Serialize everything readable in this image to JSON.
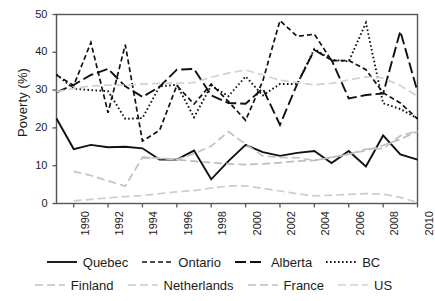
{
  "chart_data": {
    "type": "line",
    "title": "",
    "xlabel": "",
    "ylabel": "Poverty (%)",
    "xlim": [
      1989,
      2010
    ],
    "ylim": [
      0,
      50
    ],
    "grid": false,
    "legend_position": "bottom",
    "x": [
      1989,
      1990,
      1991,
      1992,
      1993,
      1994,
      1995,
      1996,
      1997,
      1998,
      1999,
      2000,
      2001,
      2002,
      2003,
      2004,
      2005,
      2006,
      2007,
      2008,
      2009,
      2010
    ],
    "xticks": [
      1990,
      1992,
      1994,
      1996,
      1998,
      2000,
      2002,
      2004,
      2006,
      2008,
      2010
    ],
    "xticklabels": [
      "1990",
      "1992",
      "1994",
      "1996",
      "1998",
      "2000",
      "2002",
      "2004",
      "2006",
      "2008",
      "2010"
    ],
    "yticks": [
      0,
      10,
      20,
      30,
      40,
      50
    ],
    "yticklabels": [
      "0",
      "10",
      "20",
      "30",
      "40",
      "50"
    ],
    "series": [
      {
        "name": "Quebec",
        "color": "#111111",
        "style": "solid",
        "dash": "none",
        "width": 1.9,
        "values": [
          22.5,
          14.4,
          15.5,
          14.9,
          15.0,
          14.6,
          11.6,
          11.6,
          14.0,
          6.4,
          11.2,
          15.5,
          13.6,
          12.6,
          13.4,
          13.9,
          10.7,
          13.9,
          9.8,
          18.0,
          13.0,
          11.6
        ]
      },
      {
        "name": "Ontario",
        "color": "#111111",
        "style": "dashed",
        "dash": "5,3",
        "width": 1.7,
        "values": [
          34.0,
          31.2,
          42.6,
          24.0,
          42.0,
          16.5,
          19.4,
          31.2,
          26.3,
          31.6,
          27.0,
          22.0,
          32.4,
          48.4,
          44.2,
          44.8,
          37.8,
          37.8,
          35.4,
          29.3,
          26.6,
          22.4
        ]
      },
      {
        "name": "Alberta",
        "color": "#111111",
        "style": "longdash",
        "dash": "11,4",
        "width": 1.9,
        "values": [
          29.4,
          31.4,
          34.0,
          35.6,
          31.0,
          28.2,
          30.9,
          35.4,
          35.6,
          28.6,
          26.6,
          26.4,
          30.4,
          20.8,
          31.6,
          40.6,
          38.0,
          27.8,
          28.7,
          29.1,
          45.6,
          29.6
        ]
      },
      {
        "name": "BC",
        "color": "#111111",
        "style": "dotted",
        "dash": "1.6,2.4",
        "width": 1.9,
        "values": [
          34.1,
          30.4,
          30.0,
          29.7,
          22.4,
          22.6,
          31.0,
          31.4,
          22.8,
          31.2,
          28.4,
          33.6,
          28.6,
          31.6,
          31.6,
          40.9,
          38.0,
          37.6,
          47.8,
          26.5,
          25.0,
          22.5
        ]
      },
      {
        "name": "Finland",
        "color": "#c2c2c2",
        "style": "dashed",
        "dash": "8,4",
        "width": 1.7,
        "values": [
          null,
          8.5,
          7.4,
          6.0,
          4.6,
          12.2,
          12.0,
          11.6,
          13.2,
          15.2,
          19.0,
          15.7,
          12.6,
          12.2,
          12.1,
          11.4,
          12.2,
          13.0,
          14.4,
          14.5,
          17.9,
          19.2
        ]
      },
      {
        "name": "Netherlands",
        "color": "#cccccc",
        "style": "dashed",
        "dash": "8,4",
        "width": 1.7,
        "values": [
          null,
          0.7,
          1.1,
          1.5,
          1.8,
          2.1,
          2.6,
          3.1,
          3.4,
          4.1,
          4.6,
          4.7,
          4.0,
          3.3,
          2.6,
          2.0,
          2.2,
          2.4,
          2.6,
          2.5,
          1.6,
          0.3
        ]
      },
      {
        "name": "France",
        "color": "#bdbdbd",
        "style": "dashed",
        "dash": "8,4",
        "width": 1.7,
        "values": [
          null,
          null,
          null,
          null,
          null,
          12.2,
          11.9,
          11.6,
          11.2,
          10.8,
          10.5,
          10.3,
          10.5,
          10.8,
          11.2,
          11.4,
          12.2,
          13.1,
          14.0,
          15.4,
          17.0,
          19.1
        ]
      },
      {
        "name": "US",
        "color": "#d2d2d2",
        "style": "dashed",
        "dash": "8,4",
        "width": 1.7,
        "values": [
          29.6,
          30.4,
          31.1,
          31.3,
          31.3,
          31.6,
          31.8,
          31.8,
          32.0,
          33.4,
          34.5,
          35.3,
          34.0,
          32.6,
          32.0,
          31.4,
          31.8,
          32.7,
          33.5,
          33.2,
          31.2,
          28.4
        ]
      }
    ]
  },
  "legend": {
    "rows": [
      [
        {
          "label": "Quebec",
          "series": 0
        },
        {
          "label": "Ontario",
          "series": 1
        },
        {
          "label": "Alberta",
          "series": 2
        },
        {
          "label": "BC",
          "series": 3
        }
      ],
      [
        {
          "label": "Finland",
          "series": 4
        },
        {
          "label": "Netherlands",
          "series": 5
        },
        {
          "label": "France",
          "series": 6
        },
        {
          "label": "US",
          "series": 7
        }
      ]
    ]
  },
  "axes": {
    "frame_color": "#555555",
    "background": "#ffffff"
  }
}
